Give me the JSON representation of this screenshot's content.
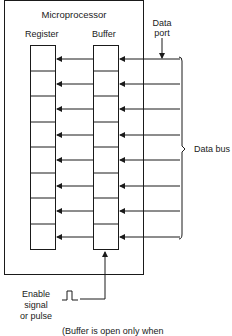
{
  "diagram": {
    "title": "Microprocessor",
    "register_label": "Register",
    "buffer_label": "Buffer",
    "data_port_line1": "Data",
    "data_port_line2": "port",
    "data_bus_label": "Data bus",
    "enable_line1": "Enable",
    "enable_line2": "signal",
    "enable_line3": "or pulse",
    "caption": "(Buffer is open only when",
    "bit_count": 8,
    "colors": {
      "line": "#1a1a1a",
      "background": "#ffffff"
    }
  }
}
